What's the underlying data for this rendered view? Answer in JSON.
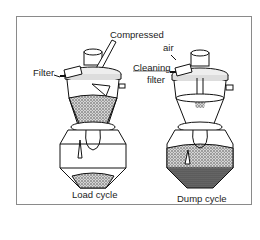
{
  "figure": {
    "labels": {
      "compressed_air_1": "Compressed",
      "compressed_air_2": "air",
      "filter": "Filter",
      "cleaning_filter_1": "Cleaning",
      "cleaning_filter_2": "filter",
      "load_cycle": "Load cycle",
      "dump_cycle": "Dump cycle"
    },
    "panels": [
      {
        "name": "load-cycle",
        "state": "material filling hopper"
      },
      {
        "name": "dump-cycle",
        "state": "material discharged to bin"
      }
    ]
  }
}
